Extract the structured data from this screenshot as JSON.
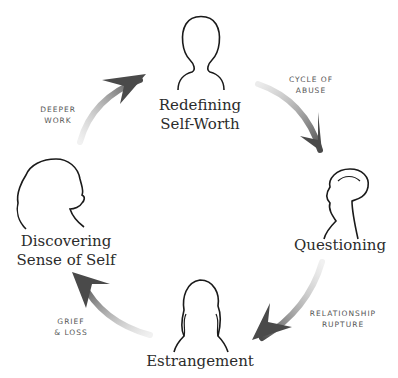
{
  "diagram": {
    "type": "cycle",
    "nodes": [
      {
        "id": "redefining",
        "line1": "Redefining",
        "line2": "Self-Worth"
      },
      {
        "id": "questioning",
        "line1": "Questioning",
        "line2": ""
      },
      {
        "id": "estrangement",
        "line1": "Estrangement",
        "line2": ""
      },
      {
        "id": "discovering",
        "line1": "Discovering",
        "line2": "Sense of Self"
      }
    ],
    "edges": [
      {
        "from": "redefining",
        "to": "questioning",
        "line1": "CYCLE OF",
        "line2": "ABUSE"
      },
      {
        "from": "questioning",
        "to": "estrangement",
        "line1": "RELATIONSHIP",
        "line2": "RUPTURE"
      },
      {
        "from": "estrangement",
        "to": "discovering",
        "line1": "GRIEF",
        "line2": "& LOSS"
      },
      {
        "from": "discovering",
        "to": "redefining",
        "line1": "DEEPER",
        "line2": "WORK"
      }
    ],
    "icons": [
      "woman-short-hair-silhouette-icon",
      "woman-hair-bun-silhouette-icon",
      "woman-long-wavy-hair-silhouette-icon",
      "woman-curly-hair-profile-silhouette-icon"
    ],
    "colors": {
      "text": "#2b2b2b",
      "arrow": "#555555",
      "label": "#555555"
    }
  }
}
